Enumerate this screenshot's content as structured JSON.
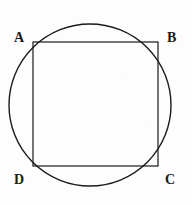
{
  "figure": {
    "kind": "geometry-diagram",
    "canvas": {
      "width": 192,
      "height": 205
    },
    "background_color": "#fdfdfd",
    "stroke_color": "#1b1b1b",
    "label_color": "#1b1b1b",
    "shapes": {
      "circle": {
        "name": "circumscribed-circle",
        "cx": 90,
        "cy": 105,
        "r": 81,
        "stroke_width": 1.4,
        "fill": "none"
      },
      "square": {
        "name": "inscribed-square",
        "x": 33,
        "y": 42,
        "width": 125,
        "height": 124,
        "stroke_width": 1.2,
        "fill": "none"
      }
    },
    "vertices": [
      {
        "id": "A",
        "label": "A",
        "position": "top-left",
        "x": 33,
        "y": 42
      },
      {
        "id": "B",
        "label": "B",
        "position": "top-right",
        "x": 158,
        "y": 42
      },
      {
        "id": "C",
        "label": "C",
        "position": "bottom-right",
        "x": 158,
        "y": 166
      },
      {
        "id": "D",
        "label": "D",
        "position": "bottom-left",
        "x": 33,
        "y": 166
      }
    ]
  }
}
